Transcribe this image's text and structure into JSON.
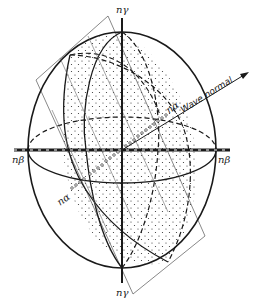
{
  "figure": {
    "type": "optical indicatrix diagram (biaxial crystal)",
    "labels": {
      "top_axis": "nγ",
      "bottom_axis": "nγ",
      "left_axis": "nβ",
      "right_axis": "nβ",
      "optic_axis_upper": "nα",
      "optic_axis_lower": "nα",
      "wave_normal": "Wave normal"
    },
    "colors": {
      "line": "#1a1a1a",
      "background": "#ffffff",
      "stipple": "#333333"
    }
  }
}
